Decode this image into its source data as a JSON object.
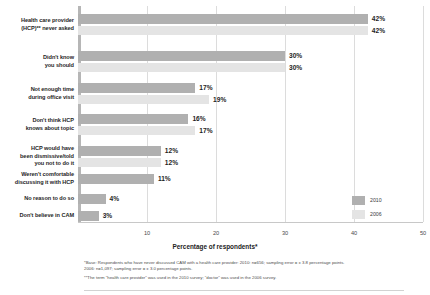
{
  "chart_data": {
    "type": "bar",
    "orientation": "horizontal",
    "title": "",
    "xlabel": "Percentage of respondents*",
    "ylabel": "",
    "xlim": [
      0,
      50
    ],
    "xticks": [
      10,
      20,
      30,
      40,
      50
    ],
    "grid": true,
    "legend_position": "bottom-right",
    "categories": [
      "Health care provider (HCP)** never asked",
      "Didn't know you should",
      "Not enough time during office visit",
      "Don't think HCP knows about topic",
      "HCP would have been dismissive/told you not to do it",
      "Weren't comfortable discussing it with HCP",
      "No reason to do so",
      "Don't believe in CAM"
    ],
    "series": [
      {
        "name": "2010",
        "color": "#b0b0b0",
        "values": [
          42,
          30,
          17,
          16,
          12,
          11,
          4,
          3
        ],
        "labels": [
          "42%",
          "30%",
          "17%",
          "16%",
          "12%",
          "11%",
          "4%",
          "3%"
        ]
      },
      {
        "name": "2006",
        "color": "#e4e4e4",
        "values": [
          42,
          30,
          19,
          17,
          12,
          null,
          null,
          null
        ],
        "labels": [
          "42%",
          "30%",
          "19%",
          "17%",
          "12%",
          "",
          "",
          ""
        ]
      }
    ]
  },
  "categories_display": [
    [
      "Health care provider",
      "(HCP)** never asked"
    ],
    [
      "Didn't know",
      "you should"
    ],
    [
      "Not enough time",
      "during office visit"
    ],
    [
      "Don't think HCP",
      "knows about topic"
    ],
    [
      "HCP would have",
      "been dismissive/told",
      "you not to do it"
    ],
    [
      "Weren't comfortable",
      "discussing it with HCP"
    ],
    [
      "No reason to do so"
    ],
    [
      "Don't believe in CAM"
    ]
  ],
  "legend": {
    "items": [
      {
        "label": "2010",
        "color": "#b0b0b0"
      },
      {
        "label": "2006",
        "color": "#e4e4e4"
      }
    ]
  },
  "axis": {
    "x_title": "Percentage of respondents*",
    "ticks": [
      "10",
      "20",
      "30",
      "40",
      "50"
    ]
  },
  "footnotes": [
    "*Base: Respondents who have never discussed CAM with a health care provider: 2010: n=656; sampling error = ± 3.8 percentage points.",
    "2006: n=1,097; sampling error = ± 3.0 percentage points.",
    "**The term \"health care provider\" was used in the 2010 survey; \"doctor\" was used in the 2006 survey."
  ]
}
